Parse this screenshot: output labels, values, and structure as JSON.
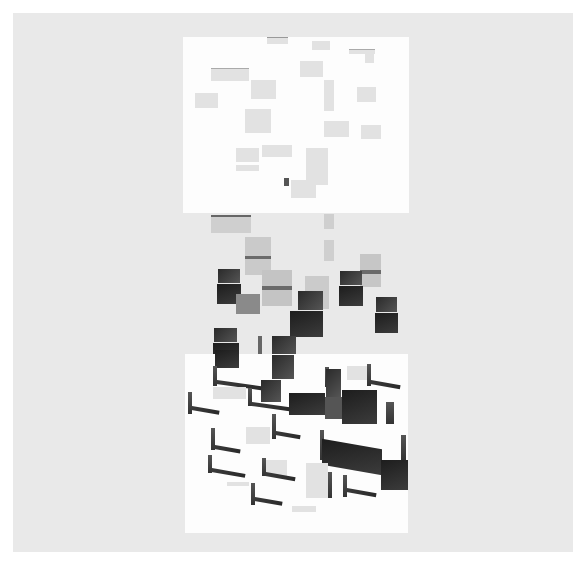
{
  "artwork": {
    "type": "abstract geometric composition",
    "background_color": "#ffffff",
    "paper_color": "#e9e9e9",
    "panel_color": "#fdfdfd",
    "top_panel": {
      "x": 183,
      "y": 37,
      "w": 226,
      "h": 176,
      "content": "scattered faint light-gray rectangles"
    },
    "middle_band": {
      "content": "overlapping gray and dark gradient squares transitioning downward"
    },
    "bottom_panel": {
      "x": 185,
      "y": 354,
      "w": 223,
      "h": 179,
      "content": "dark L-shaped and diagonal bar forms"
    }
  }
}
